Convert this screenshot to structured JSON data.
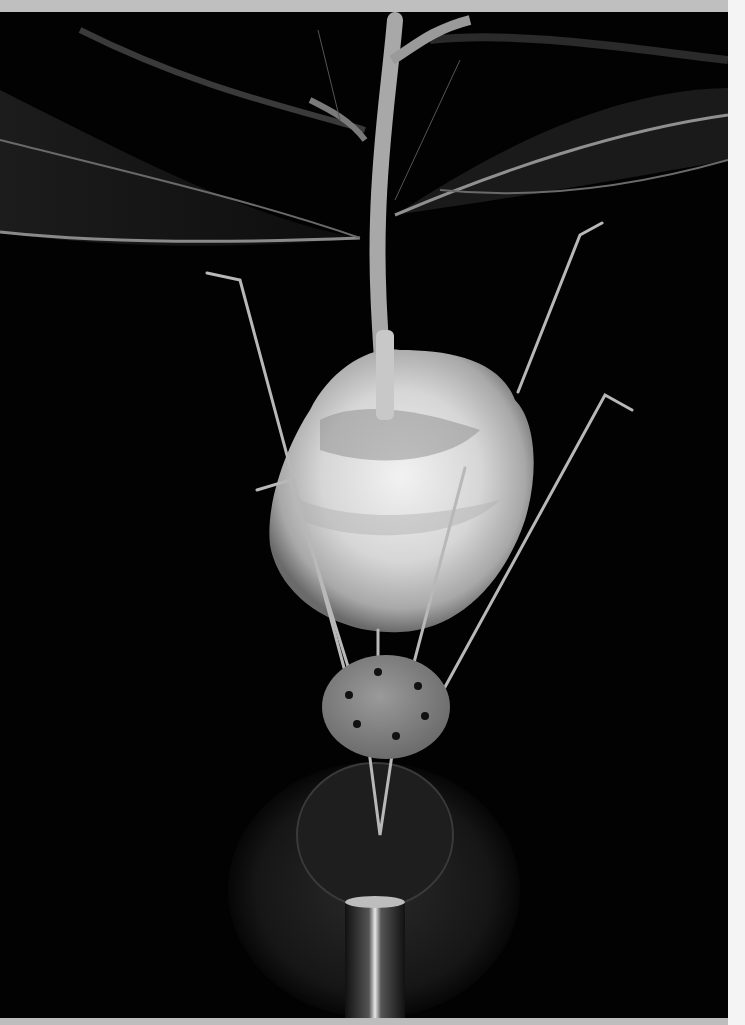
{
  "image": {
    "subject": "Foamy ball on a plant stem held by thin bent metal wires on a metal disc stand",
    "background_color": "#020202",
    "top_band_color": "#bfbfbf",
    "right_margin_color": "#f4f4f4",
    "elements": [
      {
        "name": "leaves",
        "description": "Large dark leaves with bright midribs spreading left and right"
      },
      {
        "name": "stem",
        "description": "Pale vertical stem branching near top"
      },
      {
        "name": "foam-ball",
        "description": "Rough white foamy/crumbly ball pierced by stem"
      },
      {
        "name": "wires",
        "description": "Six thin metal wires with bent hook tips"
      },
      {
        "name": "disc",
        "description": "Small grey metal disc with holes holding wires"
      },
      {
        "name": "base",
        "description": "Large round dark metal base with cylindrical pedestal"
      }
    ]
  }
}
